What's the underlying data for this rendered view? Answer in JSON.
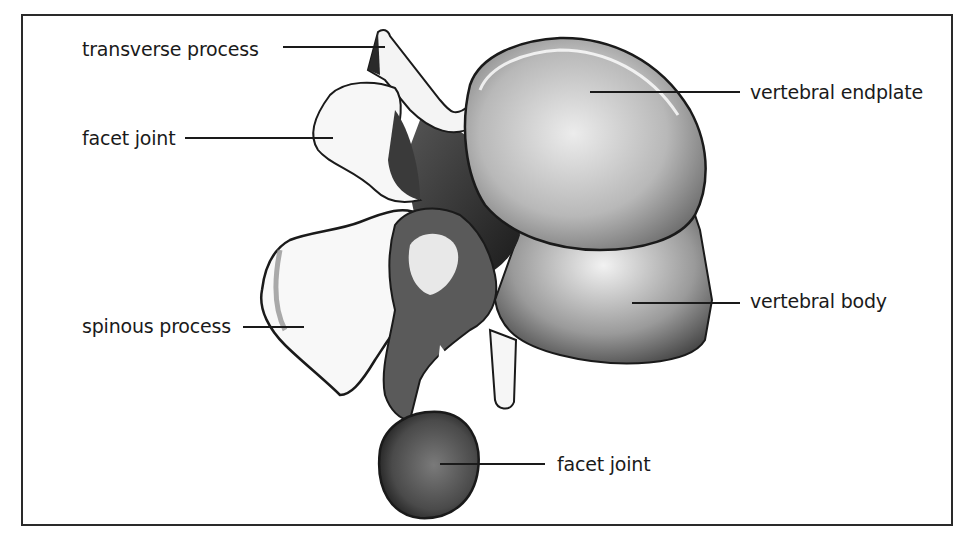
{
  "figure": {
    "border_color": "#2a2a2a",
    "labels": [
      {
        "id": "transverse-process",
        "text": "transverse process",
        "x": 82,
        "y": 40,
        "line": {
          "x1": 283,
          "x2": 385,
          "y": 47
        }
      },
      {
        "id": "facet-joint-upper",
        "text": "facet joint",
        "x": 82,
        "y": 129,
        "line": {
          "x1": 185,
          "x2": 333,
          "y": 138
        }
      },
      {
        "id": "vertebral-endplate",
        "text": "vertebral endplate",
        "x": 750,
        "y": 83,
        "line": {
          "x1": 590,
          "x2": 740,
          "y": 92
        }
      },
      {
        "id": "spinous-process",
        "text": "spinous process",
        "x": 82,
        "y": 317,
        "line": {
          "x1": 243,
          "x2": 304,
          "y": 327
        }
      },
      {
        "id": "vertebral-body",
        "text": "vertebral body",
        "x": 750,
        "y": 292,
        "line": {
          "x1": 632,
          "x2": 740,
          "y": 303
        }
      },
      {
        "id": "facet-joint-lower",
        "text": "facet joint",
        "x": 557,
        "y": 455,
        "line": {
          "x1": 440,
          "x2": 545,
          "y": 464
        }
      }
    ]
  }
}
